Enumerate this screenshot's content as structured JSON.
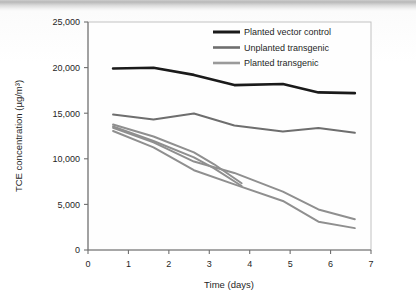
{
  "figure": {
    "name": "tce-concentration-line-chart",
    "background_color": "#ffffff",
    "plot_border_color": "#bcbcbc",
    "axis_color": "#7a7a7a"
  },
  "chart_data": {
    "type": "line",
    "title": "",
    "xlabel": "Time (days)",
    "ylabel": "TCE concentration (µg/m³)",
    "xlim": [
      0,
      7
    ],
    "ylim": [
      0,
      25000
    ],
    "xticks": [
      0,
      1,
      2,
      3,
      4,
      5,
      6,
      7
    ],
    "xtick_labels": [
      "0",
      "1",
      "2",
      "3",
      "4",
      "5",
      "6",
      "7"
    ],
    "yticks": [
      0,
      5000,
      10000,
      15000,
      20000,
      25000
    ],
    "ytick_labels": [
      "0",
      "5,000",
      "10,000",
      "15,000",
      "20,000",
      "25,000"
    ],
    "grid": false,
    "legend_position": "top-right",
    "series": [
      {
        "name": "Planted vector control",
        "color": "#1a1a1a",
        "width": 2.6,
        "points": [
          [
            0.62,
            19900
          ],
          [
            1.62,
            19980
          ],
          [
            2.62,
            19200
          ],
          [
            3.62,
            18080
          ],
          [
            4.82,
            18200
          ],
          [
            5.7,
            17280
          ],
          [
            6.6,
            17200
          ]
        ]
      },
      {
        "name": "Unplanted transgenic",
        "color": "#6e6e6e",
        "width": 2.0,
        "points": [
          [
            0.62,
            14850
          ],
          [
            1.62,
            14300
          ],
          [
            2.62,
            14960
          ],
          [
            3.62,
            13660
          ],
          [
            4.82,
            13000
          ],
          [
            5.7,
            13380
          ],
          [
            6.6,
            12850
          ]
        ]
      },
      {
        "name": "Planted transgenic",
        "color": "#8f8f8f",
        "width": 2.0,
        "replicates": [
          {
            "id": "planted-transgenic-rep-1",
            "points": [
              [
                0.62,
                13760
              ],
              [
                1.62,
                12450
              ],
              [
                2.62,
                10700
              ],
              [
                3.12,
                9400
              ],
              [
                3.8,
                7320
              ]
            ]
          },
          {
            "id": "planted-transgenic-rep-2",
            "points": [
              [
                0.62,
                13560
              ],
              [
                1.62,
                11950
              ],
              [
                2.62,
                10150
              ],
              [
                3.12,
                8950
              ],
              [
                3.8,
                7020
              ]
            ]
          },
          {
            "id": "planted-transgenic-rep-3",
            "points": [
              [
                0.62,
                13400
              ],
              [
                1.62,
                11800
              ],
              [
                2.62,
                9700
              ],
              [
                3.62,
                8450
              ],
              [
                4.82,
                6400
              ],
              [
                5.7,
                4450
              ],
              [
                6.6,
                3380
              ]
            ]
          },
          {
            "id": "planted-transgenic-rep-4",
            "points": [
              [
                0.62,
                13050
              ],
              [
                1.62,
                11250
              ],
              [
                2.62,
                8750
              ],
              [
                3.62,
                7200
              ],
              [
                4.82,
                5380
              ],
              [
                5.7,
                3100
              ],
              [
                6.6,
                2400
              ]
            ]
          }
        ]
      }
    ],
    "legend": [
      {
        "label": "Planted vector control",
        "color": "#1a1a1a",
        "width": 3.0
      },
      {
        "label": "Unplanted transgenic",
        "color": "#6e6e6e",
        "width": 2.6
      },
      {
        "label": "Planted transgenic",
        "color": "#9a9a9a",
        "width": 2.6
      }
    ]
  }
}
